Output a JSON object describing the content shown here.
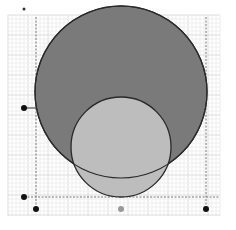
{
  "canvas": {
    "width": 236,
    "height": 230,
    "background": "#ffffff"
  },
  "grid": {
    "x0": 8,
    "y0": 15,
    "x1": 220,
    "y1": 216,
    "minor": 4,
    "major": 20,
    "minor_color": "#eeeeee",
    "major_color": "#dcdcdc"
  },
  "guides": {
    "vertical_left_x": 36,
    "vertical_right_x": 206,
    "vertical_top_y": 17,
    "vertical_bottom_y": 209,
    "horizontal_y": 197,
    "horizontal_left_x": 24,
    "horizontal_right_x": 220,
    "color": "#777777"
  },
  "shapes": {
    "large_circle": {
      "cx": 121,
      "cy": 92,
      "r": 86,
      "fill": "#7a7a7a",
      "stroke": "#2a2a2a"
    },
    "small_circle": {
      "cx": 121,
      "cy": 147,
      "r": 50,
      "fill": "#bdbdbd",
      "stroke": "#2a2a2a"
    }
  },
  "points": [
    {
      "name": "top-left-marker",
      "cx": 24,
      "cy": 9,
      "r": 1.5,
      "fill": "#333333"
    },
    {
      "name": "radius-handle-left",
      "cx": 24,
      "cy": 108,
      "r": 3,
      "fill": "#111111"
    },
    {
      "name": "corner-left-handle",
      "cx": 24,
      "cy": 197,
      "r": 3,
      "fill": "#111111"
    },
    {
      "name": "bottom-left-handle",
      "cx": 36,
      "cy": 209,
      "r": 3,
      "fill": "#111111"
    },
    {
      "name": "bottom-center-handle",
      "cx": 121,
      "cy": 209,
      "r": 3,
      "fill": "#999999"
    },
    {
      "name": "bottom-right-handle",
      "cx": 206,
      "cy": 209,
      "r": 3,
      "fill": "#111111"
    }
  ],
  "connector": {
    "x1": 24,
    "y1": 108,
    "x2": 36,
    "y2": 108
  }
}
